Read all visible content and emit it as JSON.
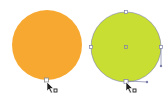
{
  "canvas": {
    "shapes": [
      {
        "name": "orange-circle",
        "fill": "#F7A831",
        "selected": false
      },
      {
        "name": "green-circle",
        "fill": "#C9DE33",
        "selected": true
      }
    ],
    "selection_color": "#7B7FA8",
    "cursor_icon": "direct-selection-arrow-icon",
    "cursor_label": "anchor-point-cursor"
  }
}
